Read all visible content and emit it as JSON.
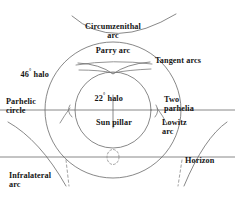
{
  "figure": {
    "title_visible": false,
    "background_color": "#ffffff",
    "line_color": "#555555",
    "text_color": "#141414"
  },
  "labels": {
    "circumzenithal_arc": "Circumzenithal\narc",
    "parry_arc": "Parry arc",
    "tangent_arcs": "Tangent arcs",
    "halo_46": "46",
    "halo_46_deg": "°",
    "halo_46_rest": " halo",
    "halo_22": "22",
    "halo_22_deg": "°",
    "halo_22_rest": " halo",
    "parhelic_circle": "Parhelic\ncircle",
    "two_parhelia": "Two\nparhelia",
    "sun_pillar": "Sun pillar",
    "lowitz_arc": "Lowitz\narc",
    "horizon": "Horizon",
    "infralateral_arc": "Infralateral\narc"
  },
  "geometry": {
    "center": {
      "x": 113,
      "y": 110
    },
    "halo_46_radius": 68,
    "halo_22_radius": 38,
    "parhelic_circle_y": 110,
    "horizon_y": 157,
    "sun_pillar": {
      "x": 113,
      "y_top": 95,
      "y_bottom": 128
    },
    "subsun": {
      "cx": 113,
      "cy": 157,
      "rx": 6,
      "ry": 7
    }
  },
  "elements": [
    "circumzenithal-arc",
    "46-halo-circle",
    "22-halo-circle",
    "parry-arc",
    "upper-tangent-arc",
    "lower-tangent-arc",
    "parhelic-circle-line",
    "horizon-line",
    "sun-pillar-line",
    "left-parhelion",
    "right-parhelion",
    "lowitz-arc-left",
    "lowitz-arc-right",
    "infralateral-arc-left",
    "infralateral-arc-right",
    "subsun-ellipse"
  ]
}
